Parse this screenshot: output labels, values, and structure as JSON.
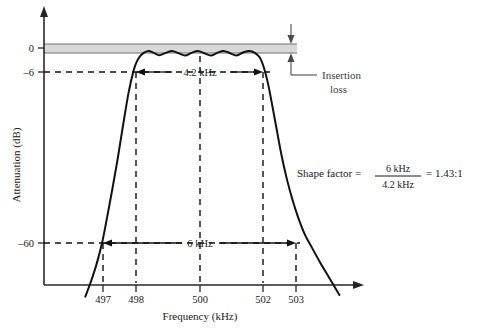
{
  "chart_data": {
    "type": "line",
    "title": "",
    "xlabel": "Frequency (kHz)",
    "ylabel": "Attenuation (dB)",
    "xtick_labels": [
      "497",
      "498",
      "500",
      "502",
      "503"
    ],
    "xtick_values": [
      497,
      498,
      500,
      502,
      503
    ],
    "ytick_labels": [
      "0",
      "–6",
      "–60"
    ],
    "ytick_values": [
      0,
      -6,
      -60
    ],
    "xlim": [
      496.2,
      504.6
    ],
    "ylim": [
      -78,
      4
    ],
    "grid": false,
    "legend": "none",
    "series": [
      {
        "name": "Filter response",
        "x": [
          496.45,
          496.62,
          496.8,
          496.97,
          497.12,
          497.28,
          497.45,
          497.62,
          497.8,
          497.95,
          498.05,
          498.16,
          498.28,
          498.42,
          498.58,
          498.75,
          498.95,
          499.15,
          499.35,
          499.55,
          499.75,
          499.95,
          500.15,
          500.35,
          500.55,
          500.75,
          500.95,
          501.15,
          501.35,
          501.55,
          501.72,
          501.88,
          502.0,
          502.12,
          502.24,
          502.38,
          502.55,
          502.72,
          502.9,
          503.08,
          503.28,
          503.5,
          503.75,
          504.05,
          504.35
        ],
        "y": [
          -76.5,
          -72.0,
          -66.5,
          -60.0,
          -52.5,
          -44.0,
          -34.5,
          -24.0,
          -13.5,
          -7.0,
          -4.2,
          -2.4,
          -1.4,
          -0.9,
          -1.5,
          -2.2,
          -1.5,
          -0.9,
          -1.6,
          -2.3,
          -1.5,
          -0.9,
          -1.6,
          -2.3,
          -1.5,
          -0.9,
          -1.6,
          -2.3,
          -1.4,
          -0.9,
          -1.5,
          -3.0,
          -6.0,
          -10.5,
          -16.5,
          -24.0,
          -33.0,
          -40.5,
          -47.0,
          -52.5,
          -57.5,
          -61.5,
          -66.0,
          -71.0,
          -76.0
        ]
      }
    ],
    "annotations": {
      "bandwidth_6db": {
        "label": "4.2 kHz",
        "from": 498,
        "to": 502,
        "level_db": -6
      },
      "bandwidth_60db": {
        "label": "6 kHz",
        "from": 497,
        "to": 503,
        "level_db": -60
      },
      "insertion_loss": {
        "label_line1": "Insertion",
        "label_line2": "loss"
      }
    },
    "formula": {
      "lhs": "Shape factor =",
      "numerator": "6 kHz",
      "denominator": "4.2 kHz",
      "equals": "= 1.43:1"
    },
    "colors": {
      "curve": "#111111",
      "axis": "#262626",
      "insertion_band": "#d8d8d8",
      "callout": "#3d3d3d"
    }
  }
}
